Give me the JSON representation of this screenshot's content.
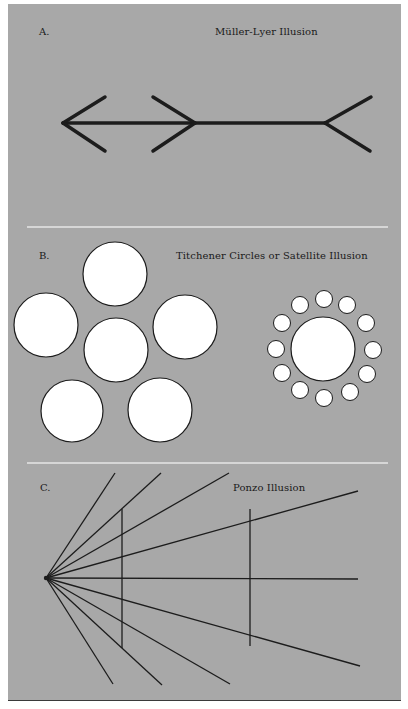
{
  "colors": {
    "background": "#ffffff",
    "panel": "#a8a8a8",
    "stroke": "#1c1c1c",
    "circle_fill": "#ffffff",
    "divider": "#e6e6e6"
  },
  "sections": [
    {
      "letter": "A.",
      "title": "Müller-Lyer Illusion"
    },
    {
      "letter": "B.",
      "title": "Titchener Circles or Satellite Illusion"
    },
    {
      "letter": "C.",
      "title": "Ponzo Illusion"
    }
  ],
  "muller_lyer": {
    "shaft": {
      "x1": 63,
      "y1": 123,
      "x2": 325,
      "y2": 123
    },
    "fins": [
      {
        "x1": 63,
        "y1": 123,
        "x2": 105,
        "y2": 97
      },
      {
        "x1": 63,
        "y1": 123,
        "x2": 105,
        "y2": 151
      },
      {
        "x1": 195,
        "y1": 123,
        "x2": 153,
        "y2": 97
      },
      {
        "x1": 195,
        "y1": 123,
        "x2": 153,
        "y2": 151
      },
      {
        "x1": 325,
        "y1": 123,
        "x2": 371,
        "y2": 97
      },
      {
        "x1": 325,
        "y1": 123,
        "x2": 370,
        "y2": 151
      }
    ]
  },
  "titchener": {
    "large_group": [
      {
        "cx": 115,
        "cy": 274,
        "r": 32
      },
      {
        "cx": 46,
        "cy": 325,
        "r": 32
      },
      {
        "cx": 116,
        "cy": 350,
        "r": 32
      },
      {
        "cx": 185,
        "cy": 327,
        "r": 32
      },
      {
        "cx": 72,
        "cy": 411,
        "r": 31
      },
      {
        "cx": 160,
        "cy": 410,
        "r": 32
      }
    ],
    "satellite_center": {
      "cx": 323,
      "cy": 349,
      "r": 32
    },
    "satellites": [
      {
        "cx": 324,
        "cy": 299,
        "r": 8.5
      },
      {
        "cx": 347,
        "cy": 305,
        "r": 8.5
      },
      {
        "cx": 366,
        "cy": 323,
        "r": 8.5
      },
      {
        "cx": 373,
        "cy": 350,
        "r": 8.5
      },
      {
        "cx": 367,
        "cy": 374,
        "r": 8.5
      },
      {
        "cx": 350,
        "cy": 392,
        "r": 8.5
      },
      {
        "cx": 324,
        "cy": 398,
        "r": 8.5
      },
      {
        "cx": 300,
        "cy": 390,
        "r": 8.5
      },
      {
        "cx": 282,
        "cy": 373,
        "r": 8.5
      },
      {
        "cx": 276,
        "cy": 349,
        "r": 8.5
      },
      {
        "cx": 282,
        "cy": 323,
        "r": 8.5
      },
      {
        "cx": 300,
        "cy": 305,
        "r": 8.5
      }
    ]
  },
  "ponzo": {
    "origin": {
      "x": 46,
      "y": 578
    },
    "rays": [
      {
        "x2": 115,
        "y2": 473
      },
      {
        "x2": 161,
        "y2": 473
      },
      {
        "x2": 229,
        "y2": 473
      },
      {
        "x2": 358,
        "y2": 491
      },
      {
        "x2": 358,
        "y2": 579
      },
      {
        "x2": 360,
        "y2": 666
      },
      {
        "x2": 230,
        "y2": 684
      },
      {
        "x2": 162,
        "y2": 685
      },
      {
        "x2": 113,
        "y2": 684
      }
    ],
    "verticals": [
      {
        "x": 122,
        "y1": 509,
        "y2": 648
      },
      {
        "x": 250,
        "y1": 509,
        "y2": 646
      }
    ]
  },
  "dividers": [
    {
      "x1": 27,
      "x2": 388,
      "y": 227
    },
    {
      "x1": 27,
      "x2": 388,
      "y": 463
    }
  ]
}
